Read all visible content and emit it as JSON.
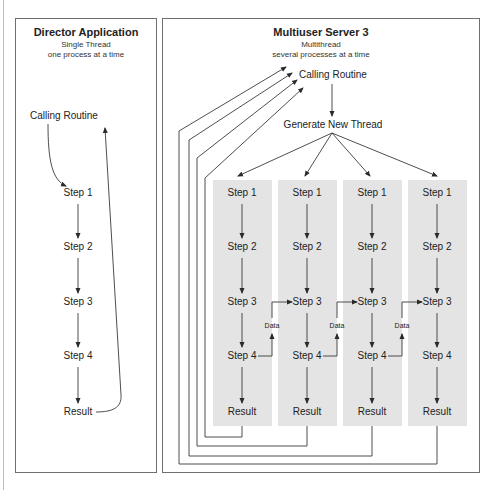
{
  "director": {
    "title": "Director Application",
    "subtitle1": "Single Thread",
    "subtitle2": "one process at a time",
    "calling_routine": "Calling Routine",
    "steps": [
      "Step 1",
      "Step 2",
      "Step 3",
      "Step 4"
    ],
    "result": "Result"
  },
  "server": {
    "title": "Multiuser Server 3",
    "subtitle1": "Multithread",
    "subtitle2": "several processes at a time",
    "calling_routine": "Calling Routine",
    "generate": "Generate New Thread",
    "threads": [
      {
        "steps": [
          "Step 1",
          "Step 2",
          "Step 3",
          "Step 4"
        ],
        "result": "Result"
      },
      {
        "steps": [
          "Step 1",
          "Step 2",
          "Step 3",
          "Step 4"
        ],
        "result": "Result"
      },
      {
        "steps": [
          "Step 1",
          "Step 2",
          "Step 3",
          "Step 4"
        ],
        "result": "Result"
      },
      {
        "steps": [
          "Step 1",
          "Step 2",
          "Step 3",
          "Step 4"
        ],
        "result": "Result"
      }
    ],
    "data_labels": [
      "Data",
      "Data",
      "Data"
    ]
  },
  "colors": {
    "line": "#3a3a3a",
    "panel_border": "#6f6f6f",
    "column_fill": "#e4e4e4"
  }
}
